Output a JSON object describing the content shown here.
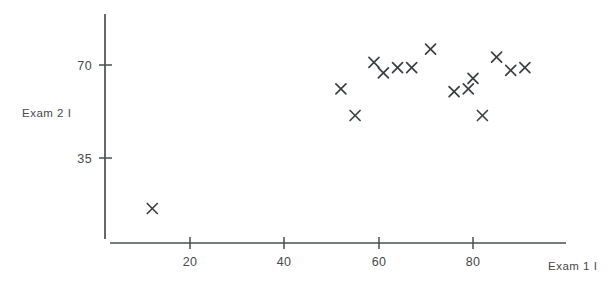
{
  "chart_data": {
    "type": "scatter",
    "title": "",
    "xlabel": "Exam 1 I",
    "ylabel": "Exam 2 I",
    "xlim": [
      0,
      100
    ],
    "ylim": [
      0,
      84
    ],
    "grid": false,
    "legend": null,
    "marker": "x",
    "marker_color": "#3d4043",
    "axis_color": "#4b4f52",
    "background": "#ffffff",
    "xticks": [
      20,
      40,
      60,
      80
    ],
    "xticklabels": [
      "20",
      "40",
      "60",
      "80"
    ],
    "yticks": [
      35,
      70
    ],
    "yticklabels": [
      "35",
      "70"
    ],
    "points": [
      {
        "x": 12,
        "y": 16
      },
      {
        "x": 52,
        "y": 61
      },
      {
        "x": 55,
        "y": 51
      },
      {
        "x": 59,
        "y": 71
      },
      {
        "x": 61,
        "y": 67
      },
      {
        "x": 64,
        "y": 69
      },
      {
        "x": 67,
        "y": 69
      },
      {
        "x": 71,
        "y": 76
      },
      {
        "x": 76,
        "y": 60
      },
      {
        "x": 79,
        "y": 61
      },
      {
        "x": 80,
        "y": 65
      },
      {
        "x": 82,
        "y": 51
      },
      {
        "x": 85,
        "y": 73
      },
      {
        "x": 88,
        "y": 68
      },
      {
        "x": 91,
        "y": 69
      }
    ]
  },
  "axes": {
    "x_label": "Exam 1 I",
    "y_label": "Exam 2 I",
    "x_tick_labels": [
      "20",
      "40",
      "60",
      "80"
    ],
    "y_tick_labels": [
      "70",
      "35"
    ]
  }
}
